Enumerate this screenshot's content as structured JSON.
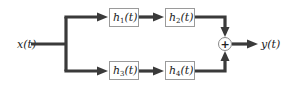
{
  "diagram": {
    "type": "block-diagram",
    "input": {
      "label": "x(t)"
    },
    "output": {
      "label": "y(t)"
    },
    "blocks": [
      {
        "id": "h1",
        "name": "h",
        "sub": "1",
        "arg": "(t)",
        "row": "top",
        "order": 1
      },
      {
        "id": "h2",
        "name": "h",
        "sub": "2",
        "arg": "(t)",
        "row": "top",
        "order": 2
      },
      {
        "id": "h3",
        "name": "h",
        "sub": "3",
        "arg": "(t)",
        "row": "bottom",
        "order": 1
      },
      {
        "id": "h4",
        "name": "h",
        "sub": "4",
        "arg": "(t)",
        "row": "bottom",
        "order": 2
      }
    ],
    "summing_junction": {
      "symbol": "+"
    },
    "connections": [
      "x(t) -> h1(t)",
      "h1(t) -> h2(t)",
      "h2(t) -> +",
      "x(t) -> h3(t)",
      "h3(t) -> h4(t)",
      "h4(t) -> +",
      "+ -> y(t)"
    ]
  }
}
